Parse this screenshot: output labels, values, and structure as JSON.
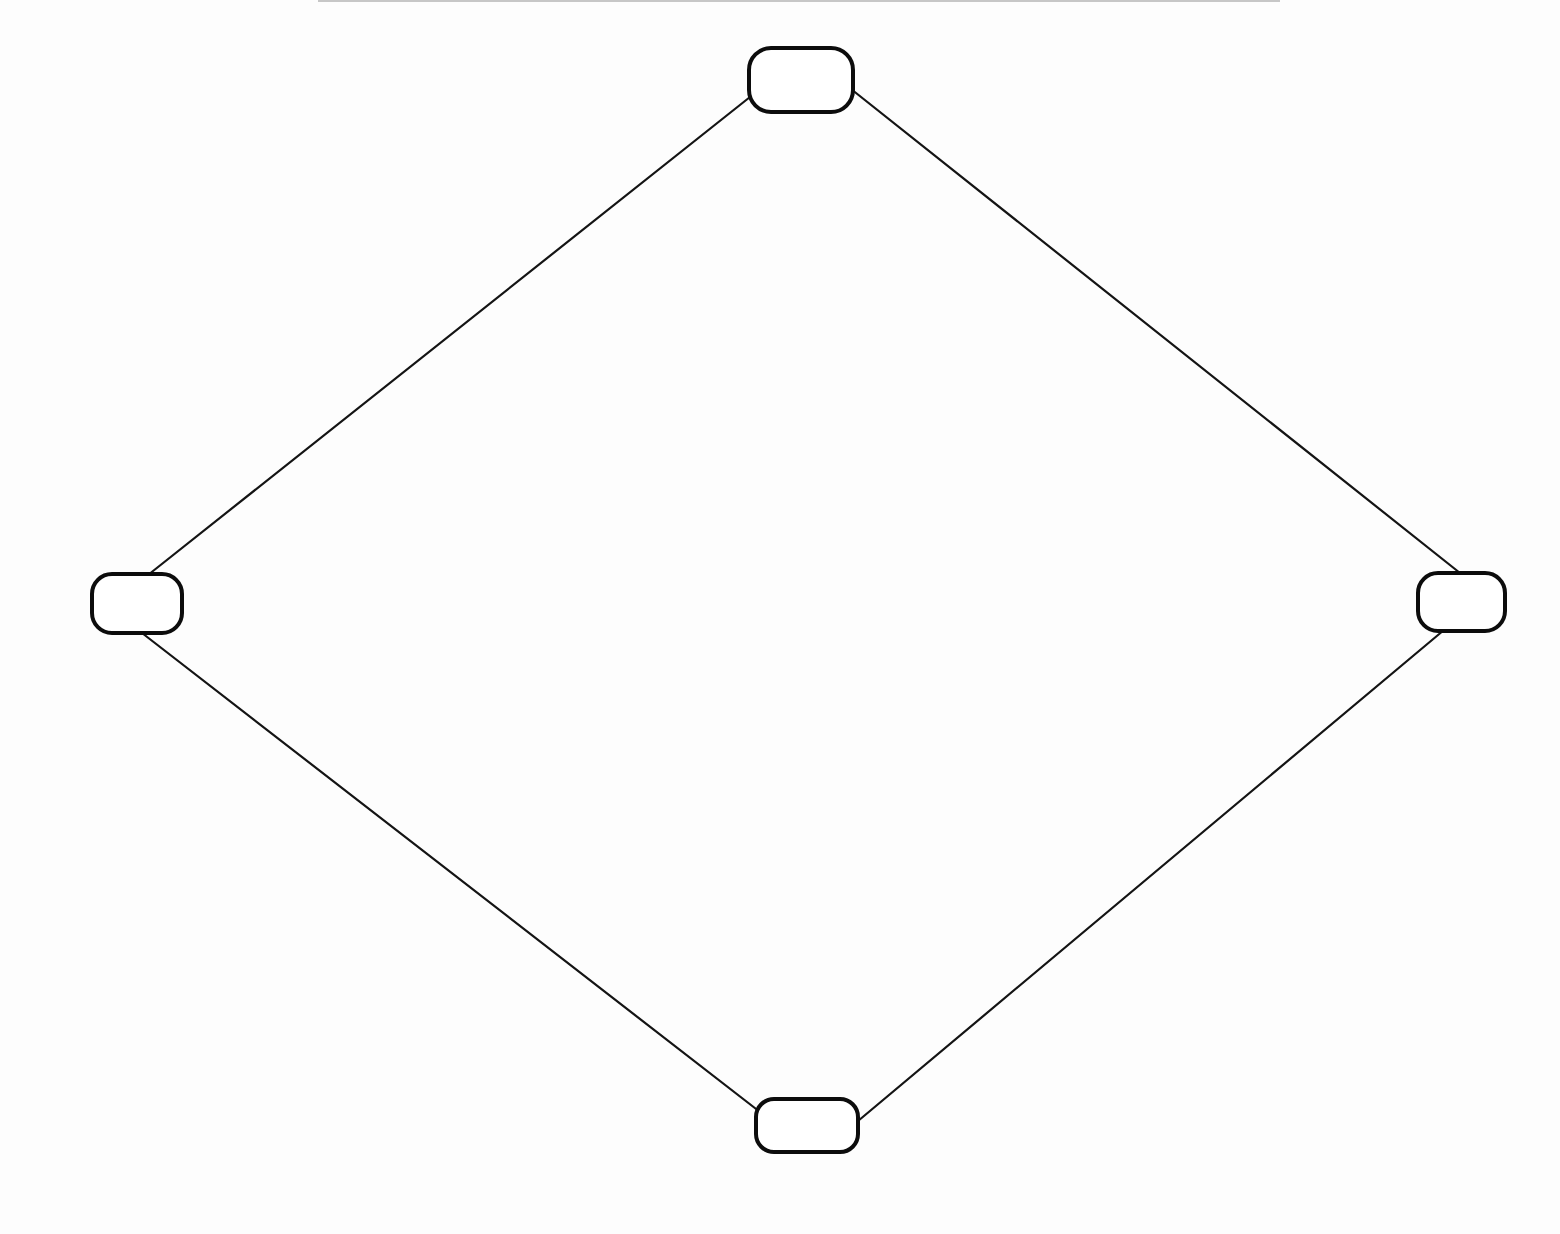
{
  "diagram": {
    "type": "graph",
    "style": "hand-drawn",
    "background_color": "#fdfdfd",
    "stroke_color": "#111111",
    "nodes": [
      {
        "id": "top",
        "label": "",
        "x": 749,
        "y": 48,
        "w": 104,
        "h": 64,
        "rx": 22
      },
      {
        "id": "left",
        "label": "",
        "x": 92,
        "y": 574,
        "w": 90,
        "h": 59,
        "rx": 20
      },
      {
        "id": "right",
        "label": "",
        "x": 1418,
        "y": 573,
        "w": 87,
        "h": 58,
        "rx": 20
      },
      {
        "id": "bottom",
        "label": "",
        "x": 756,
        "y": 1099,
        "w": 102,
        "h": 53,
        "rx": 18
      }
    ],
    "edges": [
      {
        "from": "top",
        "to": "left",
        "x1": 750,
        "y1": 97,
        "x2": 148,
        "y2": 575
      },
      {
        "from": "top",
        "to": "right",
        "x1": 851,
        "y1": 89,
        "x2": 1460,
        "y2": 573
      },
      {
        "from": "left",
        "to": "bottom",
        "x1": 142,
        "y1": 633,
        "x2": 760,
        "y2": 1112
      },
      {
        "from": "right",
        "to": "bottom",
        "x1": 1444,
        "y1": 630,
        "x2": 858,
        "y2": 1121
      }
    ]
  }
}
